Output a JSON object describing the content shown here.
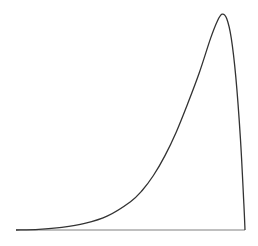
{
  "chart_data": {
    "type": "line",
    "title": "",
    "xlabel": "",
    "ylabel": "",
    "grid": false,
    "legend": null,
    "xlim": [
      0,
      1
    ],
    "ylim": [
      0,
      1
    ],
    "x": [
      0.0,
      0.1,
      0.2,
      0.3,
      0.4,
      0.5,
      0.55,
      0.6,
      0.65,
      0.7,
      0.75,
      0.8,
      0.85,
      0.88,
      0.9,
      0.92,
      0.94,
      0.96,
      0.98,
      0.995,
      1.0
    ],
    "y": [
      0.0,
      0.003,
      0.012,
      0.03,
      0.065,
      0.13,
      0.18,
      0.25,
      0.34,
      0.45,
      0.58,
      0.72,
      0.88,
      0.96,
      0.99,
      0.97,
      0.88,
      0.7,
      0.42,
      0.12,
      0.0
    ],
    "colors": {
      "line": "#333333",
      "baseline": "#aaaaaa",
      "background": "#ffffff"
    }
  },
  "plot_area": {
    "x0": 16,
    "x1": 245,
    "y_base": 230,
    "y_top": 12
  }
}
